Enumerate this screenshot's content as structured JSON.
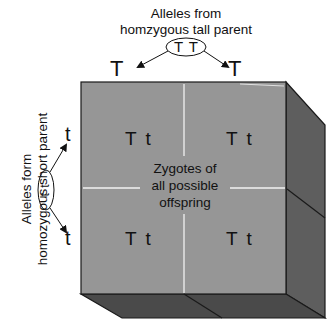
{
  "diagram": {
    "type": "punnett-square-3d",
    "top_parent": {
      "label_line1": "Alleles from",
      "label_line2": "homzygous tall parent",
      "genotype": "T T",
      "alleles": [
        "T",
        "T"
      ]
    },
    "left_parent": {
      "label_line1": "Alleles form",
      "label_line2": "homozygous short parent",
      "genotype": "t t",
      "alleles": [
        "t",
        "t"
      ]
    },
    "cells": [
      {
        "row": 0,
        "col": 0,
        "genotype": "T t"
      },
      {
        "row": 0,
        "col": 1,
        "genotype": "T t"
      },
      {
        "row": 1,
        "col": 0,
        "genotype": "T t"
      },
      {
        "row": 1,
        "col": 1,
        "genotype": "T t"
      }
    ],
    "center_label": [
      "Zygotes of",
      "all possible",
      "offspring"
    ],
    "colors": {
      "front_face": "#969696",
      "right_face": "#5e5e5e",
      "bottom_face": "#4a4a4a",
      "grid_line": "#f2f2f2",
      "edge": "#1a1a1a"
    }
  }
}
